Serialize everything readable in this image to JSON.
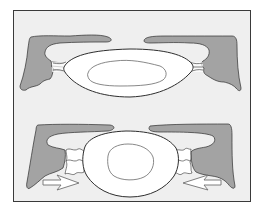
{
  "figure": {
    "type": "anatomical-illustration",
    "panels": [
      {
        "id": "top",
        "state": "normal",
        "elements": [
          "left-bone-process",
          "right-bone-process",
          "outer-ring",
          "inner-core",
          "left-ligament-connector",
          "right-ligament-connector"
        ]
      },
      {
        "id": "bottom",
        "state": "compressed",
        "elements": [
          "left-bone-process",
          "right-bone-process",
          "outer-ring",
          "inner-core",
          "left-wavy-connector",
          "right-wavy-connector",
          "right-pointing-arrow",
          "left-pointing-arrow"
        ]
      }
    ],
    "colors": {
      "frame_border": "#3a3a3a",
      "frame_background": "#efefef",
      "bone_fill": "#a3a3a3",
      "outline": "#2e2e2e",
      "ring_fill": "#ffffff",
      "inner_outline": "#6a6a6a",
      "arrow_fill": "#ffffff",
      "arrow_stroke": "#707070"
    }
  }
}
